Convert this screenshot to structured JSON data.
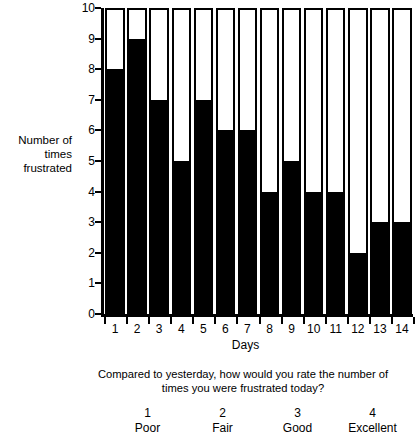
{
  "chart_data": {
    "type": "bar",
    "title": "",
    "subtitle": "",
    "xlabel": "Days",
    "ylabel": "Number of\ntimes\nfrustrated",
    "categories": [
      "1",
      "2",
      "3",
      "4",
      "5",
      "6",
      "7",
      "8",
      "9",
      "10",
      "11",
      "12",
      "13",
      "14"
    ],
    "values": [
      8,
      9,
      7,
      5,
      7,
      6,
      6,
      4,
      5,
      4,
      4,
      2,
      3,
      3
    ],
    "ylim": [
      0,
      10
    ],
    "y_ticks": [
      "0",
      "1",
      "2",
      "3",
      "4",
      "5",
      "6",
      "7",
      "8",
      "9",
      "10"
    ],
    "grid": false,
    "legend": "none",
    "bar_fill_color": "#000000",
    "bar_outline_color": "#000000",
    "bar_background_color": "#ffffff",
    "note": "Each bar is drawn as an outlined box spanning the full 0-10 axis, filled solid black from 0 up to the value."
  },
  "axes": {
    "y_title": "Number of\ntimes\nfrustrated",
    "x_title": "Days",
    "y_tick_labels": [
      "10",
      "9",
      "8",
      "7",
      "6",
      "5",
      "4",
      "3",
      "2",
      "1",
      "0"
    ],
    "x_tick_labels": [
      "1",
      "2",
      "3",
      "4",
      "5",
      "6",
      "7",
      "8",
      "9",
      "10",
      "11",
      "12",
      "13",
      "14"
    ]
  },
  "question": {
    "line1": "Compared to yesterday, how would you rate the number of",
    "line2": "times you were frustrated today?"
  },
  "rating_scale": {
    "items": [
      {
        "number": "1",
        "word": "Poor"
      },
      {
        "number": "2",
        "word": "Fair"
      },
      {
        "number": "3",
        "word": "Good"
      },
      {
        "number": "4",
        "word": "Excellent"
      }
    ]
  },
  "colors": {
    "ink": "#000000",
    "paper": "#ffffff"
  }
}
